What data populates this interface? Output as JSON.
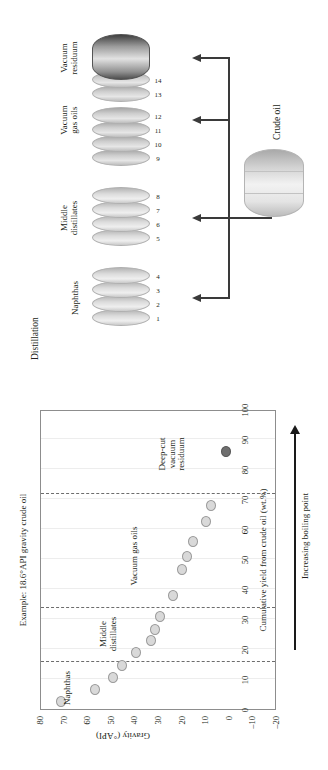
{
  "chart_data": {
    "type": "scatter",
    "title": "Example: 18.6°API gravity crude oil",
    "xlabel": "Cumulative yield from crude oil (wt.%)",
    "ylabel": "Gravity (°API)",
    "xlim": [
      0,
      100
    ],
    "ylim": [
      -20,
      80
    ],
    "xticks": [
      "0",
      "10",
      "20",
      "30",
      "40",
      "50",
      "60",
      "70",
      "80",
      "90",
      "100"
    ],
    "yticks": [
      "80",
      "70",
      "60",
      "50",
      "40",
      "30",
      "20",
      "10",
      "0",
      "–10",
      "–20"
    ],
    "grid": "vertical-light",
    "legend": "none",
    "dividers": [
      {
        "x": 15.5,
        "style": "dashed"
      },
      {
        "x": 33.5,
        "style": "dashed"
      },
      {
        "x": 71.5,
        "style": "dashed"
      }
    ],
    "group_annotations": [
      {
        "label": "Naphthas",
        "x": 7,
        "y": 62
      },
      {
        "label": "Middle\ndistillates",
        "x": 25,
        "y": 47
      },
      {
        "label": "Vacuum gas oils",
        "x": 51,
        "y": 34
      },
      {
        "label": "Deep-cut\nvacuum\nresiduum",
        "x": 85,
        "y": 22
      }
    ],
    "points": [
      {
        "x": 2.0,
        "y": 72.0,
        "group": "Naphthas"
      },
      {
        "x": 6.0,
        "y": 57.5,
        "group": "Naphthas"
      },
      {
        "x": 10.0,
        "y": 50.0,
        "group": "Naphthas"
      },
      {
        "x": 14.0,
        "y": 46.0,
        "group": "Naphthas"
      },
      {
        "x": 18.5,
        "y": 40.0,
        "group": "Middle distillates"
      },
      {
        "x": 22.5,
        "y": 34.0,
        "group": "Middle distillates"
      },
      {
        "x": 26.0,
        "y": 32.0,
        "group": "Middle distillates"
      },
      {
        "x": 30.5,
        "y": 30.0,
        "group": "Middle distillates"
      },
      {
        "x": 37.5,
        "y": 24.5,
        "group": "Vacuum gas oils"
      },
      {
        "x": 46.0,
        "y": 20.5,
        "group": "Vacuum gas oils"
      },
      {
        "x": 50.5,
        "y": 18.5,
        "group": "Vacuum gas oils"
      },
      {
        "x": 55.5,
        "y": 16.0,
        "group": "Vacuum gas oils"
      },
      {
        "x": 62.0,
        "y": 10.5,
        "group": "Vacuum gas oils"
      },
      {
        "x": 67.5,
        "y": 8.5,
        "group": "Vacuum gas oils"
      },
      {
        "x": 85.5,
        "y": 2.0,
        "group": "Deep-cut vacuum residuum",
        "dark": true
      }
    ]
  },
  "chart": {
    "title": "Example: 18.6°API gravity crude oil",
    "xaxis_title": "Cumulative yield from crude oil (wt.%)",
    "yaxis_title": "Gravity (°API)",
    "boiling_point_note": "Increasing boiling point"
  },
  "diagram": {
    "title": "Distillation",
    "crude_label": "Crude oil",
    "fractions": [
      {
        "name": "Naphthas",
        "cuts": [
          "1",
          "2",
          "3",
          "4"
        ]
      },
      {
        "name": "Middle\ndistillates",
        "cuts": [
          "5",
          "6",
          "7",
          "8"
        ]
      },
      {
        "name": "Vacuum\ngas oils",
        "cuts": [
          "9",
          "10",
          "11",
          "12",
          "13",
          "14"
        ]
      },
      {
        "name": "Vacuum\nresiduum",
        "cuts": []
      }
    ]
  }
}
